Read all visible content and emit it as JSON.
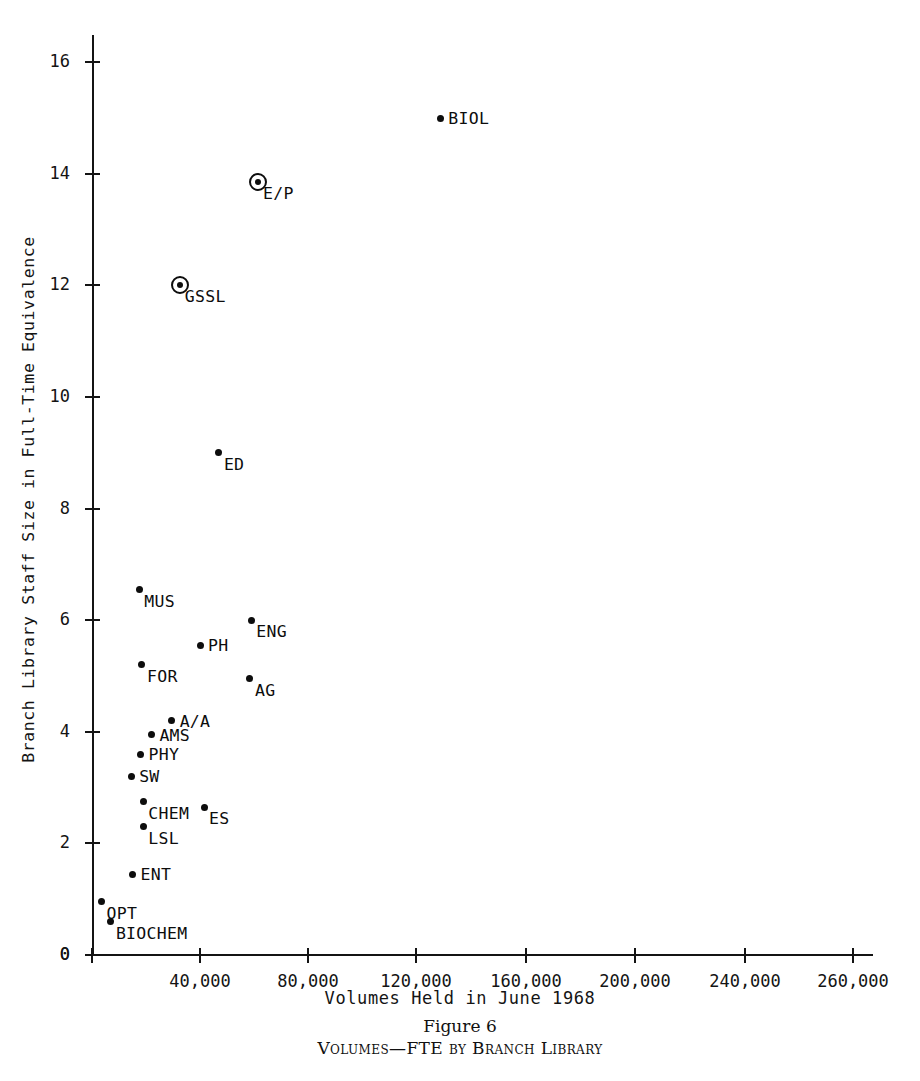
{
  "caption": {
    "figure_number": "Figure 6",
    "title": "Volumes—FTE by Branch Library"
  },
  "chart_data": {
    "type": "scatter",
    "title": "Volumes—FTE by Branch Library",
    "xlabel": "Volumes Held in June 1968",
    "ylabel": "Branch Library Staff Size in Full-Time Equivalence",
    "xlim": [
      0,
      290000
    ],
    "ylim": [
      0,
      16.6
    ],
    "grid": false,
    "legend": null,
    "x_tick_labels": [
      "0",
      "40,000",
      "80,000",
      "120,000",
      "160,000",
      "200,000",
      "240,000",
      "260,000"
    ],
    "x_tick_values": [
      0,
      40000,
      80000,
      120000,
      160000,
      200000,
      240000,
      260000
    ],
    "y_tick_labels": [
      "0",
      "2",
      "4",
      "6",
      "8",
      "10",
      "12",
      "14",
      "16"
    ],
    "y_tick_values": [
      0,
      2,
      4,
      6,
      8,
      10,
      12,
      14,
      16
    ],
    "points": [
      {
        "label": "BIOL",
        "x": 129000,
        "y": 15.0,
        "marker": "dot",
        "label_pos": "right"
      },
      {
        "label": "E/P",
        "x": 61500,
        "y": 13.85,
        "marker": "circled",
        "label_pos": "below-right"
      },
      {
        "label": "GSSL",
        "x": 32500,
        "y": 12.0,
        "marker": "circled",
        "label_pos": "below-right"
      },
      {
        "label": "ED",
        "x": 47000,
        "y": 9.0,
        "marker": "dot",
        "label_pos": "below-right"
      },
      {
        "label": "MUS",
        "x": 17500,
        "y": 6.55,
        "marker": "dot",
        "label_pos": "below-right"
      },
      {
        "label": "ENG",
        "x": 59000,
        "y": 6.0,
        "marker": "dot",
        "label_pos": "below-right"
      },
      {
        "label": "PH",
        "x": 40000,
        "y": 5.55,
        "marker": "dot",
        "label_pos": "right"
      },
      {
        "label": "FOR",
        "x": 18500,
        "y": 5.2,
        "marker": "dot",
        "label_pos": "below-right"
      },
      {
        "label": "AG",
        "x": 58500,
        "y": 4.95,
        "marker": "dot",
        "label_pos": "below-right"
      },
      {
        "label": "A/A",
        "x": 29500,
        "y": 4.2,
        "marker": "dot",
        "label_pos": "right"
      },
      {
        "label": "AMS",
        "x": 22000,
        "y": 3.95,
        "marker": "dot",
        "label_pos": "right"
      },
      {
        "label": "PHY",
        "x": 18000,
        "y": 3.6,
        "marker": "dot",
        "label_pos": "right"
      },
      {
        "label": "SW",
        "x": 14500,
        "y": 3.2,
        "marker": "dot",
        "label_pos": "right"
      },
      {
        "label": "CHEM",
        "x": 19000,
        "y": 2.75,
        "marker": "dot",
        "label_pos": "below-right"
      },
      {
        "label": "ES",
        "x": 41500,
        "y": 2.65,
        "marker": "dot",
        "label_pos": "below-right"
      },
      {
        "label": "LSL",
        "x": 19000,
        "y": 2.3,
        "marker": "dot",
        "label_pos": "below-right"
      },
      {
        "label": "ENT",
        "x": 15000,
        "y": 1.45,
        "marker": "dot",
        "label_pos": "right"
      },
      {
        "label": "OPT",
        "x": 3500,
        "y": 0.95,
        "marker": "dot",
        "label_pos": "below-right"
      },
      {
        "label": "BIOCHEM",
        "x": 7000,
        "y": 0.6,
        "marker": "dot",
        "label_pos": "below-right"
      }
    ]
  }
}
